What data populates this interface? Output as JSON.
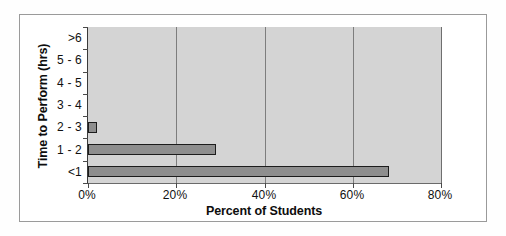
{
  "chart_data": {
    "type": "bar",
    "orientation": "horizontal",
    "title": "",
    "xlabel": "Percent of Students",
    "ylabel": "Time to Perform (hrs)",
    "categories": [
      ">6",
      "5 - 6",
      "4 - 5",
      "3 - 4",
      "2 - 3",
      "1 - 2",
      "<1"
    ],
    "values": [
      0,
      0,
      0,
      0,
      2,
      29,
      68
    ],
    "xlim": [
      0,
      80
    ],
    "xticks": [
      0,
      20,
      40,
      60,
      80
    ],
    "xtick_labels": [
      "0%",
      "20%",
      "40%",
      "60%",
      "80%"
    ],
    "grid": "vertical",
    "legend": "none",
    "bar_fill_color": "#8e8e8e",
    "bar_edge_color": "#1c1c1c",
    "plot_background_color": "#d4d4d4",
    "gridline_color": "#7d7d7d",
    "frame_color": "#9a9a9a"
  }
}
